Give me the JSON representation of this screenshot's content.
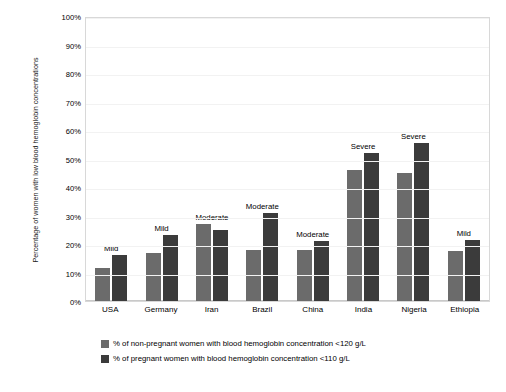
{
  "chart_data": {
    "type": "bar",
    "title": "",
    "xlabel": "",
    "ylabel": "Percentage of women with low blood hemoglobin concentrations",
    "ylim": [
      0,
      100
    ],
    "ytick_labels": [
      "100%",
      "90%",
      "80%",
      "70%",
      "60%",
      "50%",
      "40%",
      "30%",
      "20%",
      "10%",
      "0%"
    ],
    "ytick_values": [
      100,
      90,
      80,
      70,
      60,
      50,
      40,
      30,
      20,
      10,
      0
    ],
    "grid": true,
    "legend_position": "bottom",
    "categories": [
      "USA",
      "Germany",
      "Iran",
      "Brazil",
      "China",
      "India",
      "Nigeria",
      "Ethiopia"
    ],
    "series": [
      {
        "name": "% of non-pregnant women with blood hemoglobin concentration <120 g/L",
        "color": "#6b6b6b",
        "values": [
          11.5,
          17,
          27,
          18,
          18,
          46,
          45,
          17.5
        ]
      },
      {
        "name": "% of pregnant women with blood hemoglobin concentration <110 g/L",
        "color": "#3b3b3b",
        "values": [
          16,
          23,
          25,
          31,
          21,
          52,
          55.5,
          21.5
        ]
      }
    ],
    "annotations": [
      "Mild",
      "Mild",
      "Moderate",
      "Moderate",
      "Moderate",
      "Severe",
      "Severe",
      "Mild"
    ]
  },
  "legend": {
    "entries": [
      {
        "swatch": "light",
        "label": "% of non-pregnant women with blood hemoglobin concentration <120 g/L"
      },
      {
        "swatch": "dark",
        "label": "% of pregnant women with blood hemoglobin concentration <110 g/L"
      }
    ]
  }
}
